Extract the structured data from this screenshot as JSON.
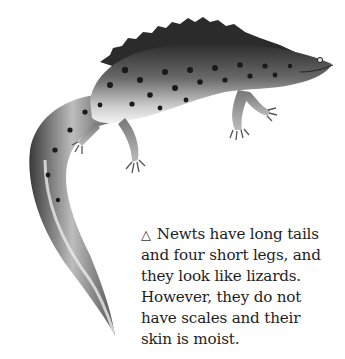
{
  "figure": {
    "marker_icon": "triangle-outline-icon",
    "marker_glyph": "△"
  },
  "caption": {
    "lines": [
      "Newts have long tails",
      "and four short legs, and",
      "they look like lizards.",
      "However, they do not",
      "have scales and their",
      "skin is moist."
    ],
    "full_text": "Newts have long tails and four short legs, and they look like lizards. However, they do not have scales and their skin is moist."
  }
}
